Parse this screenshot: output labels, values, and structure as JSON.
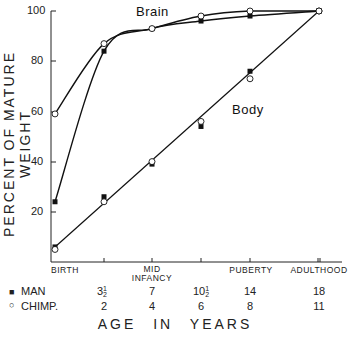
{
  "chart_data": {
    "type": "line",
    "title": "",
    "ylabel": "PERCENT OF MATURE WEIGHT",
    "xlabel": "AGE IN YEARS",
    "ylim": [
      0,
      100
    ],
    "yticks": [
      20,
      40,
      60,
      80,
      100
    ],
    "grid": false,
    "x_stage_labels": [
      "BIRTH",
      "",
      "MID INFANCY",
      "",
      "PUBERTY",
      "ADULTHOOD"
    ],
    "x_age_rows": [
      {
        "name": "MAN",
        "marker": "filled-square",
        "values": [
          "",
          "3½",
          "7",
          "10½",
          "14",
          "18"
        ]
      },
      {
        "name": "CHIMP.",
        "marker": "open-circle",
        "values": [
          "",
          "2",
          "4",
          "6",
          "8",
          "11"
        ]
      }
    ],
    "curve_labels": [
      "Brain",
      "Body"
    ],
    "series": [
      {
        "name": "Brain - Man",
        "marker": "filled-square",
        "values": [
          24,
          84,
          93,
          96,
          98,
          100
        ]
      },
      {
        "name": "Brain - Chimp",
        "marker": "open-circle",
        "values": [
          59,
          87,
          93,
          98,
          100,
          100
        ]
      },
      {
        "name": "Body - Man",
        "marker": "filled-square",
        "values": [
          6,
          26,
          39,
          54,
          76,
          100
        ]
      },
      {
        "name": "Body - Chimp",
        "marker": "open-circle",
        "values": [
          5,
          24,
          40,
          56,
          73,
          100
        ]
      }
    ]
  },
  "labels": {
    "ylabel": "PERCENT OF MATURE WEIGHT",
    "xtitle": "AGE IN YEARS",
    "brain": "Brain",
    "body": "Body",
    "yticks": [
      "100",
      "80",
      "60",
      "40",
      "20"
    ],
    "stages": {
      "birth": "BIRTH",
      "mid": "MID",
      "infancy": "INFANCY",
      "puberty": "PUBERTY",
      "adulthood": "ADULTHOOD"
    },
    "legend_man": "MAN",
    "legend_chimp": "CHIMP.",
    "man_ages": [
      "3",
      "7",
      "10",
      "14",
      "18"
    ],
    "chimp_ages": [
      "2",
      "4",
      "6",
      "8",
      "11"
    ],
    "half_num": "1",
    "half_den": "2"
  }
}
